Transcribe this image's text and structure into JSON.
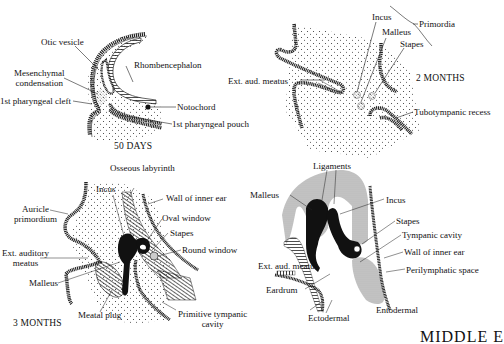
{
  "figure": {
    "section_title": "MIDDLE E",
    "panels": [
      {
        "id": "50-days",
        "stage": "50 DAYS",
        "labels": {
          "otic_vesicle": "Otic vesicle",
          "rhombencephalon": "Rhombencephalon",
          "mesenchymal_condensation": "Mesenchymal\ncondensation",
          "first_pharyngeal_cleft": "1st pharyngeal cleft",
          "notochord": "Notochord",
          "first_pharyngeal_pouch": "1st pharyngeal pouch"
        }
      },
      {
        "id": "2-months",
        "stage": "2 MONTHS",
        "labels": {
          "incus": "Incus",
          "primordia": "Primordia",
          "malleus": "Malleus",
          "stapes": "Stapes",
          "ext_aud_meatus": "Ext. aud. meatus",
          "tubotympanic_recess": "Tubotympanic recess"
        }
      },
      {
        "id": "3-months",
        "stage": "3 MONTHS",
        "labels": {
          "osseous_labyrinth": "Osseous labyrinth",
          "incus": "Incus",
          "wall_of_inner_ear": "Wall of inner ear",
          "auricle_primordium": "Auricle\nprimordium",
          "oval_window": "Oval window",
          "stapes": "Stapes",
          "round_window": "Round window",
          "ext_auditory_meatus": "Ext. auditory\nmeatus",
          "malleus": "Malleus",
          "meatal_plug": "Meatal plug",
          "primitive_tympanic_cavity": "Primitive tympanic\ncavity"
        }
      },
      {
        "id": "adult",
        "stage": "",
        "labels": {
          "ligaments": "Ligaments",
          "malleus": "Malleus",
          "incus": "Incus",
          "stapes": "Stapes",
          "tympanic_cavity": "Tympanic cavity",
          "wall_of_inner_ear": "Wall of inner ear",
          "ext_aud_meatus": "Ext. aud. meatus",
          "perilymphatic_space": "Perilymphatic space",
          "eardrum": "Eardrum",
          "ectodermal": "Ectodermal",
          "entodermal": "Entodermal"
        }
      }
    ]
  }
}
